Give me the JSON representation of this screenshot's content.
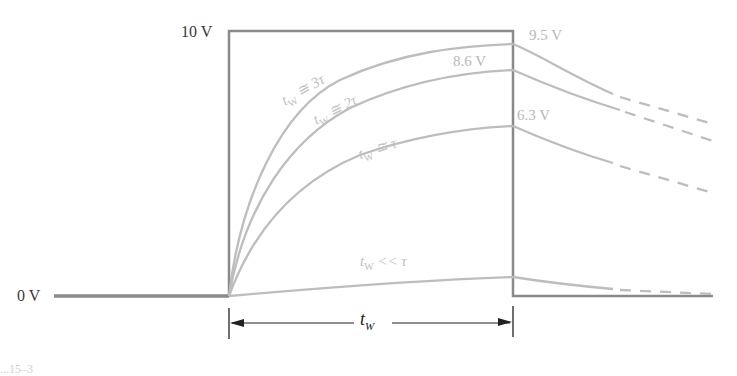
{
  "diagram": {
    "type": "rc-integrator-pulse-response",
    "axis_labels": {
      "high": "10 V",
      "low": "0 V"
    },
    "endpoint_values": [
      {
        "id": "three_tau",
        "value": "9.5 V"
      },
      {
        "id": "two_tau",
        "value": "8.6 V"
      },
      {
        "id": "one_tau",
        "value": "6.3 V"
      }
    ],
    "curves": [
      {
        "id": "three_tau",
        "label_var": "t",
        "label_sub": "W",
        "label_rel": " ≅ 3τ"
      },
      {
        "id": "two_tau",
        "label_var": "t",
        "label_sub": "W",
        "label_rel": " ≅ 2τ"
      },
      {
        "id": "one_tau",
        "label_var": "t",
        "label_sub": "W",
        "label_rel": " ≅ τ"
      },
      {
        "id": "much_less",
        "label_var": "t",
        "label_sub": "W",
        "label_rel": " << τ"
      }
    ],
    "pulse_width_label": {
      "var": "t",
      "sub": "W"
    },
    "caption_fragment": "...15–3"
  },
  "colors": {
    "pulse": "#8a8a8a",
    "baseline": "#8a8a8a",
    "curves": "#bdbdbd",
    "labels_light": "#b8b8b8",
    "labels_dark": "#3a3a3a",
    "dimension": "#222222"
  }
}
